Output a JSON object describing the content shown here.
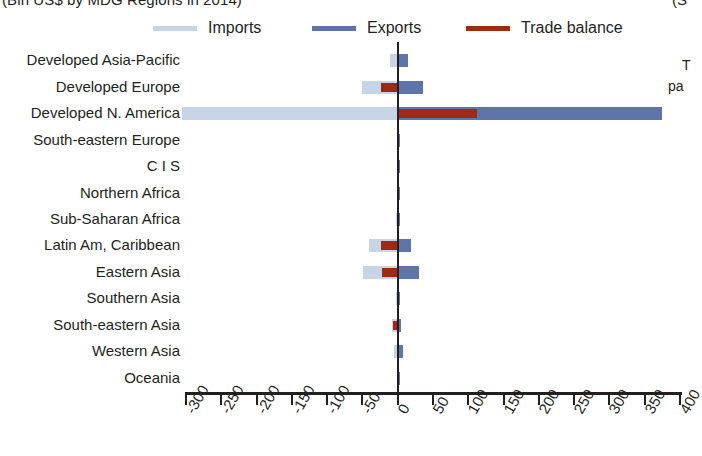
{
  "title": {
    "left_fragment": "(Bln US$ by MDG Regions in 2014)",
    "right_fragment": "(S",
    "note_fragment_1": "T",
    "note_fragment_2": "pa"
  },
  "legend": {
    "items": [
      {
        "label": "Imports",
        "color": "#c6d4e6",
        "name": "imports"
      },
      {
        "label": "Exports",
        "color": "#5f74a8",
        "name": "exports"
      },
      {
        "label": "Trade balance",
        "color": "#9e2a16",
        "name": "trade-balance"
      }
    ]
  },
  "axis": {
    "ticks": [
      "-300",
      "-250",
      "-200",
      "-150",
      "-100",
      "-50",
      "0",
      "50",
      "100",
      "150",
      "200",
      "250",
      "300",
      "350",
      "400"
    ],
    "min": -300,
    "max": 400,
    "step": 50
  },
  "chart_data": {
    "type": "bar",
    "orientation": "horizontal",
    "title": "(Bln US$ by MDG Regions in 2014)",
    "xlabel": "",
    "ylabel": "",
    "xlim": [
      -300,
      400
    ],
    "grid": false,
    "legend_position": "top",
    "categories": [
      "Developed Asia-Pacific",
      "Developed Europe",
      "Developed N. America",
      "South-eastern Europe",
      "C I S",
      "Northern Africa",
      "Sub-Saharan Africa",
      "Latin Am, Caribbean",
      "Eastern Asia",
      "Southern Asia",
      "South-eastern Asia",
      "Western Asia",
      "Oceania"
    ],
    "series": [
      {
        "name": "Imports",
        "color": "#c6d4e6",
        "values": [
          -11,
          -50,
          -305,
          -1,
          -1,
          -1,
          -2,
          -41,
          -49,
          -3,
          -8,
          -5,
          -1
        ]
      },
      {
        "name": "Exports",
        "color": "#5f74a8",
        "values": [
          14,
          36,
          375,
          1,
          1,
          1,
          2,
          19,
          30,
          3,
          5,
          8,
          1
        ]
      },
      {
        "name": "Trade balance",
        "color": "#9e2a16",
        "values": [
          0,
          -24,
          113,
          0,
          0,
          0,
          0,
          -23,
          -22,
          0,
          -7,
          0,
          0
        ]
      }
    ]
  }
}
